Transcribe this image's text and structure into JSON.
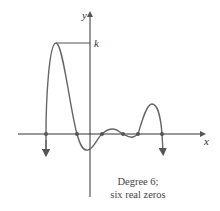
{
  "figure": {
    "axis_labels": {
      "x": "x",
      "y": "y"
    },
    "k_label": "k",
    "caption": {
      "line1": "Degree 6;",
      "line2": "six real zeros"
    },
    "colors": {
      "curve": "#666666",
      "axis": "#333333",
      "zero_dot": "#555555",
      "background": "#ffffff"
    },
    "zeros_count": 6,
    "zeros_px": [
      46,
      77,
      102,
      123,
      138,
      162
    ]
  }
}
